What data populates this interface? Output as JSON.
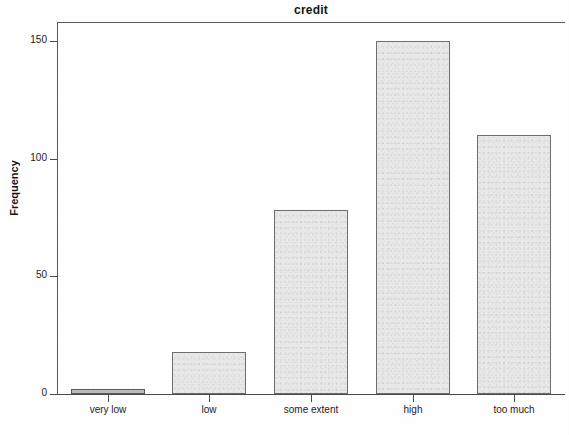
{
  "chart_data": {
    "type": "bar",
    "title": "credit",
    "xlabel": "credit",
    "ylabel": "Frequency",
    "categories": [
      "very low",
      "low",
      "some extent",
      "high",
      "too much"
    ],
    "values": [
      2,
      18,
      78,
      150,
      110
    ],
    "ylim": [
      0,
      158
    ],
    "yticks": [
      0,
      50,
      100,
      150
    ],
    "ytick_labels": [
      "0",
      "50",
      "100",
      "150"
    ],
    "grid": false,
    "legend": null,
    "bar_fill_color": "#e9e9e9",
    "bar_border_color": "#6e6e6e",
    "axis_color": "#4a4a4a",
    "background_color": "#ffffff"
  }
}
